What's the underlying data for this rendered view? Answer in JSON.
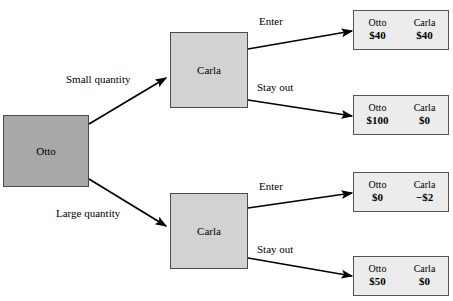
{
  "diagram": {
    "colors": {
      "otto_node_fill": "#a8a8a8",
      "carla_node_fill": "#d2d2d2",
      "payoff_fill": "#ececec",
      "border": "#4a4a4a",
      "edge": "#000000",
      "background": "#ffffff"
    }
  },
  "nodes": {
    "root": {
      "label": "Otto",
      "x": 3,
      "y": 115,
      "w": 86,
      "h": 72
    },
    "carla_top": {
      "label": "Carla",
      "x": 170,
      "y": 32,
      "w": 78,
      "h": 76
    },
    "carla_bottom": {
      "label": "Carla",
      "x": 170,
      "y": 193,
      "w": 78,
      "h": 76
    }
  },
  "edge_labels": {
    "small_quantity": {
      "text": "Small quantity",
      "x": 66,
      "y": 73
    },
    "large_quantity": {
      "text": "Large quantity",
      "x": 56,
      "y": 207
    },
    "enter_top": {
      "text": "Enter",
      "x": 259,
      "y": 15
    },
    "stay_out_top": {
      "text": "Stay out",
      "x": 257,
      "y": 81
    },
    "enter_bottom": {
      "text": "Enter",
      "x": 259,
      "y": 180
    },
    "stay_out_bottom": {
      "text": "Stay out",
      "x": 257,
      "y": 243
    }
  },
  "edges": [
    {
      "name": "otto-to-carla-top",
      "x1": 89,
      "y1": 124,
      "x2": 166,
      "y2": 78
    },
    {
      "name": "otto-to-carla-bottom",
      "x1": 89,
      "y1": 179,
      "x2": 166,
      "y2": 226
    },
    {
      "name": "carla-top-to-enter",
      "x1": 248,
      "y1": 49,
      "x2": 352,
      "y2": 31
    },
    {
      "name": "carla-top-to-stay-out",
      "x1": 248,
      "y1": 100,
      "x2": 352,
      "y2": 116
    },
    {
      "name": "carla-bottom-to-enter",
      "x1": 248,
      "y1": 208,
      "x2": 352,
      "y2": 193
    },
    {
      "name": "carla-bottom-to-stay-out",
      "x1": 248,
      "y1": 258,
      "x2": 352,
      "y2": 276
    }
  ],
  "payoffs": [
    {
      "name": "payoff-small-enter",
      "x": 353,
      "y": 10,
      "w": 96,
      "h": 40,
      "players": [
        "Otto",
        "Carla"
      ],
      "values": [
        "$40",
        "$40"
      ]
    },
    {
      "name": "payoff-small-stay-out",
      "x": 353,
      "y": 95,
      "w": 96,
      "h": 40,
      "players": [
        "Otto",
        "Carla"
      ],
      "values": [
        "$100",
        "$0"
      ]
    },
    {
      "name": "payoff-large-enter",
      "x": 353,
      "y": 172,
      "w": 96,
      "h": 40,
      "players": [
        "Otto",
        "Carla"
      ],
      "values": [
        "$0",
        "−$2"
      ]
    },
    {
      "name": "payoff-large-stay-out",
      "x": 353,
      "y": 256,
      "w": 96,
      "h": 40,
      "players": [
        "Otto",
        "Carla"
      ],
      "values": [
        "$50",
        "$0"
      ]
    }
  ]
}
